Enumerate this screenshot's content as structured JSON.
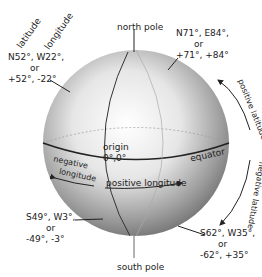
{
  "diagram": {
    "title_labels": {
      "latitude": "latitude",
      "longitude": "longitude"
    },
    "north_pole": "north pole",
    "south_pole": "south pole",
    "origin": {
      "label": "origin",
      "coords": "0°,0°"
    },
    "equator": "equator",
    "negative_longitude": [
      "negative",
      "longitude"
    ],
    "positive_longitude": "positive longitude",
    "positive_latitude": "positive latitude",
    "negative_latitude": "negative latitude",
    "points": [
      {
        "line1": "N52°, W22°,",
        "or": "or",
        "line2": "+52°,  -22°"
      },
      {
        "line1": "N71°, E84°,",
        "or": "or",
        "line2": "+71°,   +84°"
      },
      {
        "line1": "S49°, W3°,",
        "or": "or",
        "line2": "-49°,   -3°"
      },
      {
        "line1": "S62°, W35°,",
        "or": "or",
        "line2": "-62°,  +35°"
      }
    ]
  }
}
